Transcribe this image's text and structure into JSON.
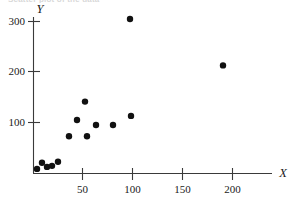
{
  "figure": {
    "top_caption_fragment": "Scatter plot of the data",
    "background_color": "#ffffff",
    "ink_color": "#111111",
    "axis_color": "#3a3a3a"
  },
  "chart_data": {
    "type": "scatter",
    "title": "",
    "xlabel": "X",
    "ylabel": "Y",
    "xlim": [
      0,
      240
    ],
    "ylim": [
      0,
      315
    ],
    "xticks": [
      50,
      100,
      150,
      200
    ],
    "yticks": [
      100,
      200,
      300
    ],
    "xtick_labels": [
      "50",
      "100",
      "150",
      "200"
    ],
    "ytick_labels": [
      "100",
      "200",
      "300"
    ],
    "grid": false,
    "legend": null,
    "marker": "filled-circle",
    "marker_color": "#111111",
    "marker_size_px": 3.2,
    "n_points": 14,
    "points": [
      {
        "x": 4,
        "y": 8
      },
      {
        "x": 9,
        "y": 20
      },
      {
        "x": 14,
        "y": 12
      },
      {
        "x": 19,
        "y": 14
      },
      {
        "x": 25,
        "y": 22
      },
      {
        "x": 36,
        "y": 72
      },
      {
        "x": 44,
        "y": 104
      },
      {
        "x": 52,
        "y": 140
      },
      {
        "x": 54,
        "y": 72
      },
      {
        "x": 63,
        "y": 94
      },
      {
        "x": 80,
        "y": 94
      },
      {
        "x": 97,
        "y": 302
      },
      {
        "x": 98,
        "y": 112
      },
      {
        "x": 190,
        "y": 211
      }
    ],
    "x_values": [
      4,
      9,
      14,
      19,
      25,
      36,
      44,
      52,
      54,
      63,
      80,
      97,
      98,
      190
    ],
    "y_values": [
      8,
      20,
      12,
      14,
      22,
      72,
      104,
      140,
      72,
      94,
      94,
      302,
      112,
      211
    ]
  },
  "geometry": {
    "origin_px": {
      "x": 33,
      "y": 173
    },
    "x_unit_px": 1.0,
    "y_unit_px": 0.51,
    "x_axis_end_px": 272,
    "y_axis_top_px": 17
  }
}
